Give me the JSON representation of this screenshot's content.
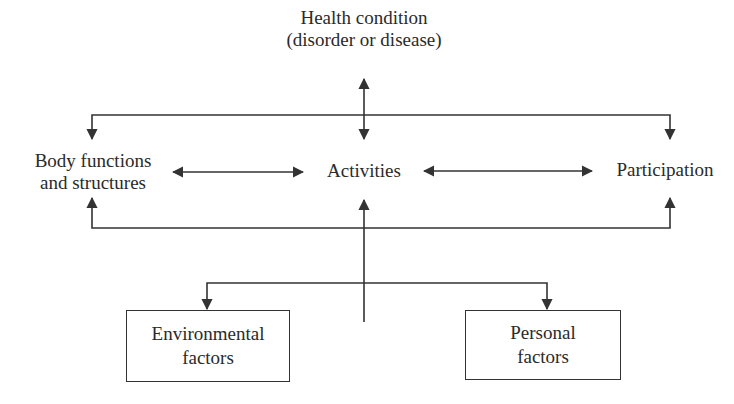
{
  "diagram": {
    "health_condition": {
      "line1": "Health condition",
      "line2": "(disorder or disease)"
    },
    "body_functions": {
      "line1": "Body functions",
      "line2": "and structures"
    },
    "activities": "Activities",
    "participation": "Participation",
    "environmental_factors": {
      "line1": "Environmental",
      "line2": "factors"
    },
    "personal_factors": {
      "line1": "Personal",
      "line2": "factors"
    },
    "line_color": "#333333",
    "text_color": "#2a2a2a"
  }
}
